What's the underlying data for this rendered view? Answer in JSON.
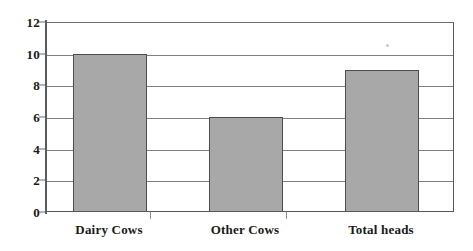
{
  "chart_data": {
    "type": "bar",
    "title": "",
    "subtitle": "",
    "xlabel": "",
    "ylabel": "",
    "categories": [
      "Dairy Cows",
      "Other Cows",
      "Total heads"
    ],
    "values": [
      10,
      6,
      9
    ],
    "series": [
      {
        "name": "",
        "values": [
          10,
          6,
          9
        ]
      }
    ],
    "ylim": [
      0,
      12
    ],
    "y_ticks": [
      0,
      2,
      4,
      6,
      8,
      10,
      12
    ],
    "y_tick_labels": [
      "0",
      "2",
      "4",
      "6",
      "8",
      "10",
      "12"
    ],
    "grid": true,
    "grid_axis": "y",
    "legend": false,
    "legend_position": "none",
    "annotations": [],
    "colors": {
      "bar_fill": "#a8a8a8",
      "bar_border": "#4a4d51",
      "gridline": "#7d8084",
      "axis": "#55585c",
      "text": "#1a1a1a",
      "background": "#ffffff"
    }
  },
  "axes": {
    "y_tick_labels": [
      "12",
      "10",
      "8",
      "6",
      "4",
      "2",
      "0"
    ],
    "x_tick_labels": [
      "Dairy Cows",
      "Other Cows",
      "Total heads"
    ]
  }
}
